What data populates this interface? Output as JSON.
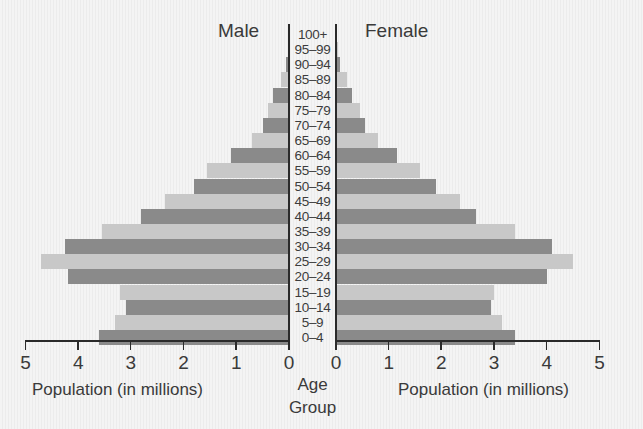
{
  "chart_data": {
    "type": "bar",
    "subtype": "population-pyramid",
    "title_left": "Male",
    "title_right": "Female",
    "xlabel_left": "Population (in millions)",
    "xlabel_right": "Population (in millions)",
    "center_label_line1": "Age",
    "center_label_line2": "Group",
    "xlim": [
      0,
      5
    ],
    "x_ticks": [
      "0",
      "1",
      "2",
      "3",
      "4",
      "5"
    ],
    "categories": [
      "100+",
      "95–99",
      "90–94",
      "85–89",
      "80–84",
      "75–79",
      "70–74",
      "65–69",
      "60–64",
      "55–59",
      "50–54",
      "45–49",
      "40–44",
      "35–39",
      "30–34",
      "25–29",
      "20–24",
      "15–19",
      "10–14",
      "5–9",
      "0–4"
    ],
    "series": [
      {
        "name": "Male",
        "values": [
          0.0,
          0.02,
          0.05,
          0.15,
          0.3,
          0.4,
          0.5,
          0.7,
          1.1,
          1.55,
          1.8,
          2.35,
          2.8,
          3.55,
          4.25,
          4.7,
          4.2,
          3.2,
          3.1,
          3.3,
          3.6
        ]
      },
      {
        "name": "Female",
        "values": [
          0.0,
          0.03,
          0.08,
          0.2,
          0.3,
          0.45,
          0.55,
          0.8,
          1.15,
          1.6,
          1.9,
          2.35,
          2.65,
          3.4,
          4.1,
          4.5,
          4.0,
          3.0,
          2.95,
          3.15,
          3.4
        ]
      }
    ],
    "bar_colors": {
      "dark": "#8a8a8a",
      "light": "#c8c8c8"
    },
    "grid": false,
    "legend": "none"
  }
}
